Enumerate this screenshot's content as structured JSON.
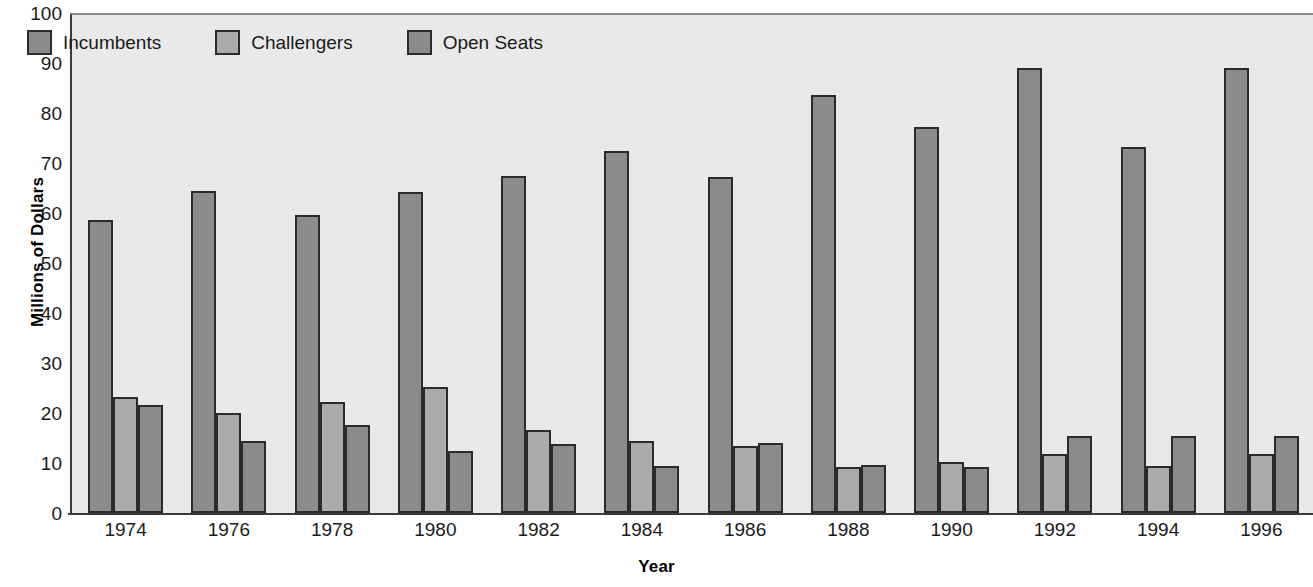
{
  "chart_data": {
    "type": "bar",
    "title": "",
    "xlabel": "Year",
    "ylabel": "Millions of Dollars",
    "ylim": [
      0,
      100
    ],
    "ytick_step": 10,
    "yticks": [
      100,
      90,
      80,
      70,
      60,
      50,
      40,
      30,
      20,
      10,
      0
    ],
    "grid": false,
    "legend_position": "top-left inside plot",
    "categories": [
      "1974",
      "1976",
      "1978",
      "1980",
      "1982",
      "1984",
      "1986",
      "1988",
      "1990",
      "1992",
      "1994",
      "1996"
    ],
    "series": [
      {
        "name": "Incumbents",
        "color": "#8b8b8b",
        "values": [
          58.6,
          64.4,
          59.6,
          64.2,
          67.4,
          72.5,
          67.2,
          83.7,
          77.2,
          89.0,
          73.2,
          89.0
        ]
      },
      {
        "name": "Challengers",
        "color": "#ababab",
        "values": [
          23.3,
          20.0,
          22.2,
          25.3,
          16.7,
          14.5,
          13.4,
          9.2,
          10.2,
          11.9,
          9.4,
          11.9
        ]
      },
      {
        "name": "Open Seats",
        "color": "#8b8b8b",
        "values": [
          21.7,
          14.4,
          17.7,
          12.4,
          13.9,
          9.4,
          14.1,
          9.6,
          9.2,
          15.5,
          15.5,
          15.5
        ]
      }
    ]
  },
  "colors": {
    "plot_background": "#e9e9e9",
    "page_background": "#ffffff",
    "axis": "#3a3a3a",
    "bar_outline": "#2b2b2b",
    "text": "#1a1a1a"
  },
  "axes": {
    "y_title": "Millions of Dollars",
    "x_title": "Year"
  }
}
